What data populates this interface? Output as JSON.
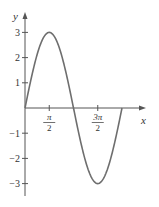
{
  "chart_data": {
    "type": "line",
    "title": "",
    "function": "y = 3 sin x",
    "xlabel": "x",
    "ylabel": "y",
    "xlim": [
      0,
      6.2832
    ],
    "ylim": [
      -3,
      3
    ],
    "grid": false,
    "legend": null,
    "x_ticks": [
      {
        "value": 1.5708,
        "label_num": "π",
        "label_den": "2"
      },
      {
        "value": 4.7124,
        "label_num": "3π",
        "label_den": "2"
      }
    ],
    "y_ticks": [
      {
        "value": 3,
        "label": "3"
      },
      {
        "value": 2,
        "label": "2"
      },
      {
        "value": 1,
        "label": "1"
      },
      {
        "value": -1,
        "label": "−1"
      },
      {
        "value": -2,
        "label": "−2"
      },
      {
        "value": -3,
        "label": "−3"
      }
    ],
    "series": [
      {
        "name": "3 sin x",
        "x": [
          0,
          0.7854,
          1.5708,
          2.3562,
          3.1416,
          3.927,
          4.7124,
          5.4978,
          6.2832
        ],
        "values": [
          0,
          2.12,
          3,
          2.12,
          0,
          -2.12,
          -3,
          -2.12,
          0
        ]
      }
    ],
    "colors": {
      "curve": "#6e6e6e",
      "axis": "#555555",
      "text": "#333333"
    }
  }
}
